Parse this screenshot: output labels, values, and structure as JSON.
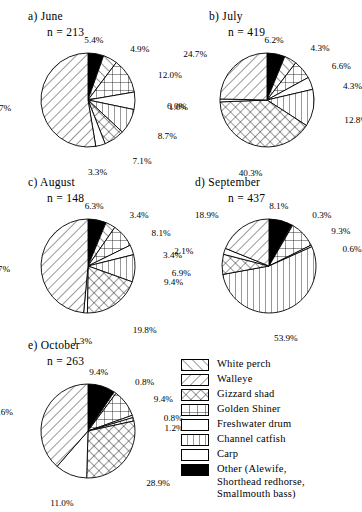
{
  "figure": {
    "type": "pie-chart-panel-figure",
    "panels_count": 5
  },
  "panels": [
    {
      "key": "june",
      "label": "a) June",
      "n_text": "n = 213",
      "n": 213
    },
    {
      "key": "july",
      "label": "b) July",
      "n_text": "n = 419",
      "n": 419
    },
    {
      "key": "august",
      "label": "c) August",
      "n_text": "n = 148",
      "n": 148
    },
    {
      "key": "september",
      "label": "d) September",
      "n_text": "n = 437",
      "n": 437
    },
    {
      "key": "october",
      "label": "e) October",
      "n_text": "n = 263",
      "n": 263
    }
  ],
  "legend": {
    "items": [
      {
        "label": "White perch",
        "pattern": "diagonal-up",
        "color": "#ffffff"
      },
      {
        "label": "Walleye",
        "pattern": "diagonal-down",
        "color": "#ffffff"
      },
      {
        "label": "Gizzard shad",
        "pattern": "crosshatch",
        "color": "#ffffff"
      },
      {
        "label": "Golden Shiner",
        "pattern": "grid",
        "color": "#ffffff"
      },
      {
        "label": "Freshwater drum",
        "pattern": "blank",
        "color": "#ffffff"
      },
      {
        "label": "Channel catfish",
        "pattern": "vertical",
        "color": "#ffffff"
      },
      {
        "label": "Carp",
        "pattern": "blank",
        "color": "#ffffff"
      },
      {
        "label": "Other (Alewife,\nShorthead redhorse,\nSmallmouth bass)",
        "pattern": "solid",
        "color": "#000000"
      }
    ]
  },
  "chart_data": [
    {
      "type": "pie",
      "title": "a) June",
      "subtitle": "n = 213",
      "n": 213,
      "categories": [
        "Other",
        "White perch",
        "Golden Shiner",
        "Freshwater drum",
        "Channel catfish",
        "Gizzard shad",
        "Carp",
        "Walleye"
      ],
      "values": [
        5.4,
        4.9,
        12.0,
        6.0,
        8.7,
        7.1,
        3.3,
        52.7
      ],
      "labels": [
        "5.4%",
        "4.9%",
        "12.0%",
        "6.0%",
        "8.7%",
        "7.1%",
        "3.3%",
        "52.7%"
      ],
      "units": "percent"
    },
    {
      "type": "pie",
      "title": "b) July",
      "subtitle": "n = 419",
      "n": 419,
      "categories": [
        "Other",
        "White perch",
        "Golden Shiner",
        "Freshwater drum",
        "Channel catfish",
        "Gizzard shad",
        "Carp",
        "Walleye"
      ],
      "values": [
        6.2,
        4.3,
        6.6,
        4.3,
        12.8,
        40.3,
        1.0,
        24.7
      ],
      "labels": [
        "6.2%",
        "4.3%",
        "6.6%",
        "4.3%",
        "12.8%",
        "40.3%",
        "1.0%",
        "24.7%"
      ],
      "units": "percent"
    },
    {
      "type": "pie",
      "title": "c) August",
      "subtitle": "n = 148",
      "n": 148,
      "categories": [
        "Other",
        "White perch",
        "Golden Shiner",
        "Freshwater drum",
        "Channel catfish",
        "Gizzard shad",
        "Carp",
        "Walleye"
      ],
      "values": [
        6.3,
        3.4,
        8.1,
        3.4,
        9.4,
        19.8,
        1.3,
        48.7
      ],
      "labels": [
        "6.3%",
        "3.4%",
        "8.1%",
        "3.4%",
        "9.4%",
        "19.8%",
        "1.3%",
        "48.7%"
      ],
      "units": "percent"
    },
    {
      "type": "pie",
      "title": "d) September",
      "subtitle": "n = 437",
      "n": 437,
      "categories": [
        "Other",
        "White perch",
        "Golden Shiner",
        "Freshwater drum",
        "Channel catfish",
        "Gizzard shad",
        "Carp",
        "Walleye"
      ],
      "values": [
        8.1,
        0.3,
        9.3,
        0.6,
        53.9,
        6.9,
        2.1,
        18.9
      ],
      "labels": [
        "8.1%",
        "0.3%",
        "9.3%",
        "0.6%",
        "53.9%",
        "6.9%",
        "2.1%",
        "18.9%"
      ],
      "units": "percent"
    },
    {
      "type": "pie",
      "title": "e) October",
      "subtitle": "n = 263",
      "n": 263,
      "categories": [
        "Other",
        "White perch",
        "Golden Shiner",
        "Freshwater drum",
        "Channel catfish",
        "Gizzard shad",
        "Carp",
        "Walleye"
      ],
      "values": [
        9.4,
        0.8,
        9.4,
        0.8,
        1.2,
        28.9,
        11.0,
        38.6
      ],
      "labels": [
        "9.4%",
        "0.8%",
        "9.4%",
        "0.8%",
        "1.2%",
        "28.9%",
        "11.0%",
        "38.6%"
      ],
      "units": "percent"
    }
  ],
  "slice_patterns": [
    "solid",
    "diagonal-up",
    "grid",
    "blank",
    "vertical",
    "crosshatch",
    "blank",
    "diagonal-down"
  ],
  "label_layout": {
    "june": [
      {
        "a": "up"
      },
      {
        "a": "ur"
      },
      {
        "a": "r"
      },
      {
        "a": "r"
      },
      {
        "a": "r"
      },
      {
        "a": "dr"
      },
      {
        "a": "down"
      },
      {
        "a": "l"
      }
    ],
    "july": [
      {
        "a": "up"
      },
      {
        "a": "ur"
      },
      {
        "a": "r"
      },
      {
        "a": "r"
      },
      {
        "a": "r"
      },
      {
        "a": "down"
      },
      {
        "a": "l"
      },
      {
        "a": "ul"
      }
    ],
    "august": [
      {
        "a": "up"
      },
      {
        "a": "ur"
      },
      {
        "a": "r"
      },
      {
        "a": "r"
      },
      {
        "a": "r"
      },
      {
        "a": "dr"
      },
      {
        "a": "down"
      },
      {
        "a": "l"
      }
    ],
    "september": [
      {
        "a": "up"
      },
      {
        "a": "ur"
      },
      {
        "a": "r"
      },
      {
        "a": "r"
      },
      {
        "a": "down"
      },
      {
        "a": "l"
      },
      {
        "a": "l"
      },
      {
        "a": "ul"
      }
    ],
    "october": [
      {
        "a": "up"
      },
      {
        "a": "ur"
      },
      {
        "a": "r"
      },
      {
        "a": "r"
      },
      {
        "a": "r"
      },
      {
        "a": "dr"
      },
      {
        "a": "down"
      },
      {
        "a": "l"
      }
    ]
  }
}
